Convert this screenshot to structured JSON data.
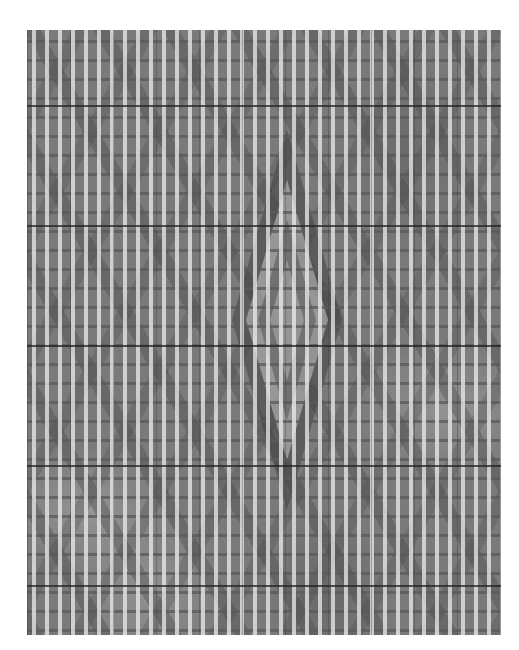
{
  "image": {
    "subject": "woven textile close-up with diamond motif",
    "colors": {
      "background": "#ffffff",
      "fabric_base": "#7a7a7a",
      "float_highlight": "#f0f0f0",
      "seam": "#232323"
    },
    "seams_y": [
      75,
      195,
      315,
      435,
      555
    ]
  }
}
